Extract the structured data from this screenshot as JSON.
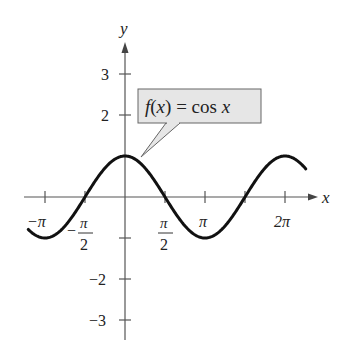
{
  "chart_data": {
    "type": "line",
    "title": "",
    "function": "cos(x)",
    "label": "f(x) = cos x",
    "label_parts": {
      "f": "f",
      "open": "(",
      "x": "x",
      "close": ")",
      "eq": " = cos ",
      "x2": "x"
    },
    "xlabel": "x",
    "ylabel": "y",
    "xlim": [
      -3.8,
      7.1
    ],
    "ylim": [
      -3.5,
      3.5
    ],
    "x_ticks": [
      {
        "value": -3.14159,
        "label": "−π"
      },
      {
        "value": -1.5708,
        "label": "−π/2"
      },
      {
        "value": 1.5708,
        "label": "π/2"
      },
      {
        "value": 3.14159,
        "label": "π"
      },
      {
        "value": 4.71239,
        "label": ""
      },
      {
        "value": 6.28319,
        "label": "2π"
      }
    ],
    "y_ticks": [
      {
        "value": 3,
        "label": "3"
      },
      {
        "value": 2,
        "label": "2"
      },
      {
        "value": 1,
        "label": ""
      },
      {
        "value": -1,
        "label": ""
      },
      {
        "value": -2,
        "label": "−2"
      },
      {
        "value": -3,
        "label": "−3"
      }
    ],
    "x": [
      -3.8,
      -3.14159,
      -1.5708,
      0,
      1.5708,
      3.14159,
      4.71239,
      6.28319,
      7.1
    ],
    "values": [
      -0.79,
      -1,
      0,
      1,
      0,
      -1,
      0,
      1,
      0.68
    ],
    "grid": false,
    "legend": "callout box"
  },
  "labels": {
    "x_axis": "x",
    "y_axis": "y",
    "neg_pi": "−π",
    "neg_half_pi_num": "π",
    "neg_half_pi_den": "2",
    "neg_sign": "−",
    "half_pi_num": "π",
    "half_pi_den": "2",
    "pi": "π",
    "two_pi": "2π",
    "y3": "3",
    "y2": "2",
    "yn2": "−2",
    "yn3": "−3"
  },
  "callout": {
    "f": "f",
    "paren_open": "(",
    "x": "x",
    "paren_close": ")",
    "eq": " = cos ",
    "x2": "x"
  },
  "colors": {
    "curve": "#111111",
    "axis": "#555555",
    "callout_fill": "#e6e6e6",
    "callout_stroke": "#666666"
  }
}
